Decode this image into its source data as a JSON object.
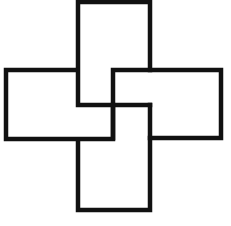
{
  "diagram": {
    "title": "",
    "stroke_color": "#111111",
    "background": "#ffffff",
    "shapes": [
      {
        "name": "top-rectangle",
        "x": 77,
        "y": 2,
        "w": 73,
        "h": 103
      },
      {
        "name": "right-rectangle",
        "x": 113,
        "y": 70,
        "w": 108,
        "h": 69
      },
      {
        "name": "bottom-rectangle",
        "x": 77,
        "y": 105,
        "w": 73,
        "h": 105
      },
      {
        "name": "left-rectangle",
        "x": 6,
        "y": 70,
        "w": 107,
        "h": 69
      }
    ]
  }
}
